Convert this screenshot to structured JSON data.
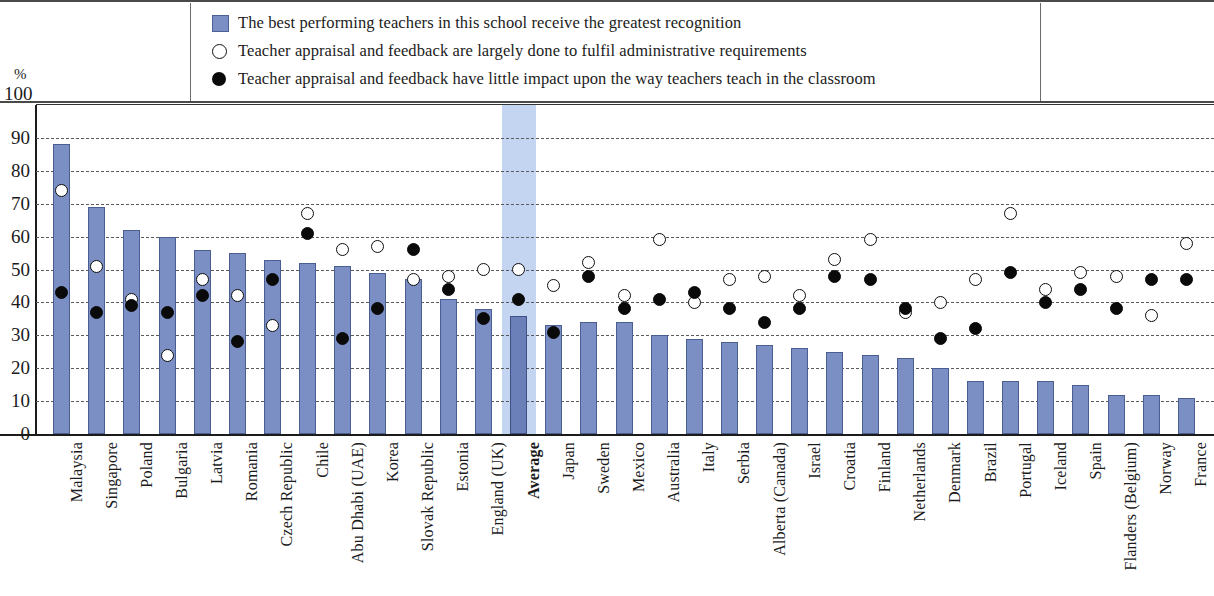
{
  "axis": {
    "unit_label": "%",
    "y_ticks": [
      "100",
      "90",
      "80",
      "70",
      "60",
      "50",
      "40",
      "30",
      "20",
      "10",
      "0"
    ],
    "y_min": 0,
    "y_max": 100
  },
  "legend": {
    "items": [
      {
        "marker": "bar-swatch-icon",
        "label": "The best performing teachers in this school receive the greatest recognition"
      },
      {
        "marker": "open-circle-icon",
        "label": "Teacher appraisal and feedback are largely done to fulfil administrative requirements"
      },
      {
        "marker": "filled-circle-icon",
        "label": "Teacher appraisal and feedback have little impact upon the way teachers teach in the classroom"
      }
    ]
  },
  "colors": {
    "bar": "#7b8fc4",
    "bar_border": "#4b5e92",
    "average_bar": "#6b80b8",
    "highlight_band": "#c3d5f0",
    "open_marker": "#ffffff",
    "filled_marker": "#0a0a0a",
    "grid": "#5a5a5a"
  },
  "chart_data": {
    "type": "bar",
    "title": "",
    "xlabel": "",
    "ylabel": "%",
    "ylim": [
      0,
      100
    ],
    "grid": true,
    "legend_position": "top",
    "categories": [
      "Malaysia",
      "Singapore",
      "Poland",
      "Bulgaria",
      "Latvia",
      "Romania",
      "Czech Republic",
      "Chile",
      "Abu Dhabi (UAE)",
      "Korea",
      "Slovak Republic",
      "Estonia",
      "England (UK)",
      "Average",
      "Japan",
      "Sweden",
      "Mexico",
      "Australia",
      "Italy",
      "Serbia",
      "Alberta (Canada)",
      "Israel",
      "Croatia",
      "Finland",
      "Netherlands",
      "Denmark",
      "Brazil",
      "Portugal",
      "Iceland",
      "Spain",
      "Flanders (Belgium)",
      "Norway",
      "France"
    ],
    "series": [
      {
        "name": "The best performing teachers in this school receive the greatest recognition",
        "type": "bar",
        "values": [
          88,
          69,
          62,
          60,
          56,
          55,
          53,
          52,
          51,
          49,
          47,
          41,
          38,
          36,
          33,
          34,
          34,
          30,
          29,
          28,
          27,
          26,
          25,
          24,
          23,
          20,
          16,
          16,
          16,
          15,
          12,
          12,
          11
        ]
      },
      {
        "name": "Teacher appraisal and feedback are largely done to fulfil administrative requirements",
        "type": "scatter",
        "marker": "open-circle",
        "values": [
          74,
          51,
          41,
          24,
          47,
          42,
          33,
          67,
          56,
          57,
          47,
          48,
          50,
          50,
          45,
          52,
          42,
          59,
          40,
          47,
          48,
          42,
          53,
          59,
          37,
          40,
          47,
          67,
          44,
          49,
          48,
          36,
          58
        ]
      },
      {
        "name": "Teacher appraisal and feedback have little impact upon the way teachers teach in the classroom",
        "type": "scatter",
        "marker": "filled-circle",
        "values": [
          43,
          37,
          39,
          37,
          42,
          28,
          47,
          61,
          29,
          38,
          56,
          44,
          35,
          41,
          31,
          48,
          38,
          41,
          43,
          38,
          34,
          38,
          48,
          47,
          38,
          29,
          32,
          49,
          40,
          44,
          38,
          47,
          47
        ]
      }
    ]
  }
}
